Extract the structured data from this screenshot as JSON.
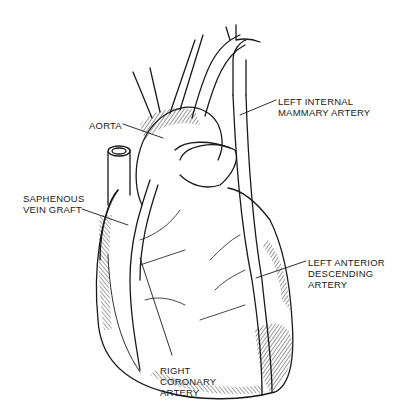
{
  "figure": {
    "colors": {
      "ink": "#1a1a1a",
      "background": "#ffffff"
    }
  },
  "labels": {
    "aorta": {
      "lines": [
        "AORTA"
      ]
    },
    "lima": {
      "lines": [
        "LEFT INTERNAL",
        "MAMMARY ARTERY"
      ]
    },
    "svg": {
      "lines": [
        "SAPHENOUS",
        "VEIN GRAFT"
      ]
    },
    "lad": {
      "lines": [
        "LEFT ANTERIOR",
        "DESCENDING",
        "ARTERY"
      ]
    },
    "rca": {
      "lines": [
        "RIGHT",
        "CORONARY",
        "ARTERY"
      ]
    }
  }
}
